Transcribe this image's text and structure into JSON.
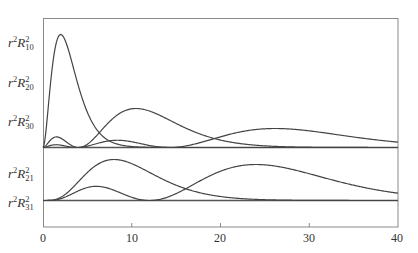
{
  "chart_data": {
    "type": "line",
    "title": "",
    "xlabel": "",
    "ylabel": "",
    "xlim": [
      0,
      40
    ],
    "x_ticks": [
      0,
      10,
      20,
      30,
      40
    ],
    "grid": false,
    "legend": "none (curves labeled at left axis)",
    "panels": [
      {
        "name": "s-orbitals (l=0)",
        "labels": [
          "r²R₁₀²",
          "r²R₂₀²",
          "r²R₃₀²"
        ],
        "series": [
          {
            "name": "r²R₁₀²",
            "x": [
              0,
              1,
              2,
              3,
              4,
              6,
              8,
              10
            ],
            "y": [
              0,
              0.73,
              1.0,
              0.82,
              0.53,
              0.16,
              0.04,
              0.01
            ]
          },
          {
            "name": "r²R₂₀²",
            "x": [
              0,
              1.5,
              4,
              6,
              8,
              10.5,
              14,
              18,
              24,
              30,
              40
            ],
            "y": [
              0,
              0.1,
              0.0,
              0.04,
              0.22,
              0.37,
              0.3,
              0.15,
              0.04,
              0.01,
              0.0
            ]
          },
          {
            "name": "r²R₃₀²",
            "x": [
              0,
              1.5,
              3.8,
              8.4,
              14.5,
              20,
              26,
              32,
              40
            ],
            "y": [
              0,
              0.03,
              0.0,
              0.05,
              0.0,
              0.12,
              0.18,
              0.15,
              0.08
            ]
          }
        ]
      },
      {
        "name": "p-orbitals (l=1)",
        "labels": [
          "r²R₂₁²",
          "r²R₃₁²"
        ],
        "series": [
          {
            "name": "r²R₂₁²",
            "x": [
              0,
              2,
              4,
              6,
              8,
              10,
              14,
              18,
              24,
              30,
              40
            ],
            "y": [
              0,
              0.03,
              0.27,
              0.7,
              0.93,
              0.9,
              0.57,
              0.26,
              0.06,
              0.01,
              0.0
            ]
          },
          {
            "name": "r²R₃₁²",
            "x": [
              0,
              2,
              5.5,
              8,
              12,
              16,
              20,
              24,
              30,
              36,
              40
            ],
            "y": [
              0,
              0.05,
              0.2,
              0.14,
              0.0,
              0.12,
              0.34,
              0.42,
              0.32,
              0.17,
              0.1
            ]
          }
        ]
      }
    ]
  },
  "axis": {
    "tick_labels": [
      "0",
      "10",
      "20",
      "30",
      "40"
    ]
  },
  "labels": {
    "r10": {
      "base": "r",
      "sup1": "2",
      "R": "R",
      "sup2": "2",
      "sub": "10"
    },
    "r20": {
      "base": "r",
      "sup1": "2",
      "R": "R",
      "sup2": "2",
      "sub": "20"
    },
    "r30": {
      "base": "r",
      "sup1": "2",
      "R": "R",
      "sup2": "2",
      "sub": "30"
    },
    "r21": {
      "base": "r",
      "sup1": "2",
      "R": "R",
      "sup2": "2",
      "sub": "21"
    },
    "r31": {
      "base": "r",
      "sup1": "2",
      "R": "R",
      "sup2": "2",
      "sub": "31"
    }
  },
  "colors": {
    "curve": "#444444",
    "axis": "#777777",
    "baseline": "#555555"
  }
}
